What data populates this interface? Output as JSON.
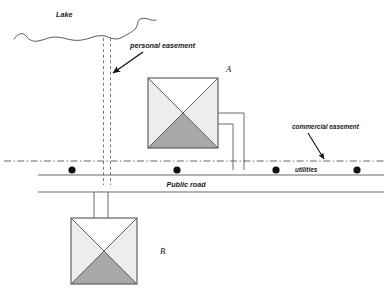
{
  "diagram": {
    "labels": {
      "lake": "Lake",
      "personal_easement": "personal easement",
      "commercial_easement": "commercial easement",
      "utilities": "utilities",
      "public_road": "Public road",
      "building_a": "A",
      "building_b": "B"
    },
    "colors": {
      "stroke": "#6b6b6b",
      "stroke_dark": "#2b2b2b",
      "roof_top": "#ffffff",
      "roof_side": "#ededed",
      "roof_front": "#a8a8a8",
      "dot": "#111111",
      "text": "#1a1a1a",
      "background": "#ffffff"
    },
    "elements": {
      "lake_shoreline": "wavy-line",
      "personal_easement_strip": "vertical-dashed-corridor",
      "commercial_easement_line": "horizontal-dash-dot-line",
      "road": "two-parallel-horizontal-lines",
      "utility_nodes_count": 4,
      "service_pipes_building_a": 2,
      "service_pipes_building_b": 2
    }
  }
}
